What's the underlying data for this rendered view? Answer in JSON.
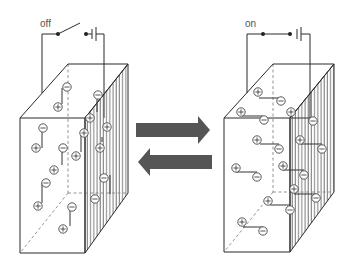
{
  "diagram": {
    "type": "electrochromic / dielectric cell switching diagram",
    "colors": {
      "line": "#2a2a2a",
      "arrow": "#555555",
      "dashed": "#888888",
      "hatch": "#666666",
      "charge_circle": "#444444"
    },
    "left_cell": {
      "switch_label": "off",
      "switch_state": "open",
      "dipole_orientation": "vertical (random)",
      "symbols": {
        "plus": "⊕",
        "minus": "⊖"
      }
    },
    "right_cell": {
      "switch_label": "on",
      "switch_state": "closed",
      "dipole_orientation": "horizontal (aligned)",
      "symbols": {
        "plus": "⊕",
        "minus": "⊖"
      }
    },
    "arrows": [
      {
        "direction": "right",
        "meaning": "off to on"
      },
      {
        "direction": "left",
        "meaning": "on to off"
      }
    ]
  }
}
